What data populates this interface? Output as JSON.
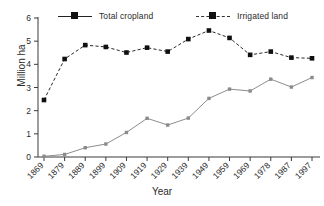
{
  "chart_data": {
    "type": "line",
    "title": "",
    "xlabel": "Year",
    "ylabel": "Million ha",
    "grid": false,
    "legend_position": "top",
    "categories": [
      "1869",
      "1879",
      "1889",
      "1899",
      "1909",
      "1919",
      "1929",
      "1939",
      "1949",
      "1959",
      "1969",
      "1978",
      "1987",
      "1997"
    ],
    "x": [
      1869,
      1879,
      1889,
      1899,
      1909,
      1919,
      1929,
      1939,
      1949,
      1959,
      1969,
      1978,
      1987,
      1997
    ],
    "xlim": [
      1869,
      1997
    ],
    "ylim": [
      0,
      6
    ],
    "yticks": [
      0,
      1,
      2,
      3,
      4,
      5,
      6
    ],
    "series": [
      {
        "name": "Total cropland",
        "marker": "filled-square",
        "linestyle": "dashed",
        "color": "#2a2a2a",
        "values": [
          2.46,
          4.23,
          4.83,
          4.75,
          4.51,
          4.72,
          4.55,
          5.09,
          5.46,
          5.14,
          4.41,
          4.55,
          4.29,
          4.26
        ]
      },
      {
        "name": "Irrigated land",
        "marker": "filled-square",
        "linestyle": "solid",
        "color": "#8a8a8a",
        "values": [
          0.03,
          0.11,
          0.4,
          0.56,
          1.06,
          1.67,
          1.38,
          1.68,
          2.53,
          2.93,
          2.85,
          3.36,
          3.02,
          3.43
        ]
      }
    ]
  },
  "legend": {
    "cropland_label": "Total cropland",
    "irrigated_label": "Irrigated land"
  },
  "axes": {
    "y_title": "Million ha",
    "x_title": "Year"
  }
}
